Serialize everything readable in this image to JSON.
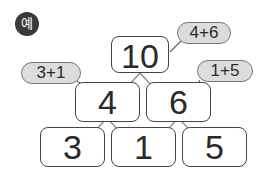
{
  "badge": {
    "label": "예"
  },
  "pyramid": {
    "top": {
      "value": "10",
      "hint": "4+6"
    },
    "middle": [
      {
        "value": "4",
        "hint": "3+1"
      },
      {
        "value": "6",
        "hint": "1+5"
      }
    ],
    "bottom": [
      {
        "value": "3"
      },
      {
        "value": "1"
      },
      {
        "value": "5"
      }
    ]
  },
  "colors": {
    "badge_bg": "#3a3a3a",
    "bubble_bg": "#dcdcdc",
    "border": "#444444"
  }
}
